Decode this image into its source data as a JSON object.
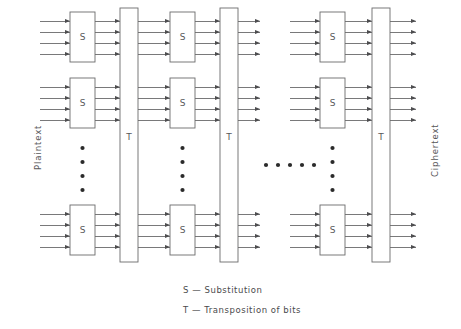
{
  "diagram": {
    "input_label": "Plaintext",
    "output_label": "Ciphertext",
    "box_label_substitution": "S",
    "box_label_transposition": "T",
    "legend": [
      "S — Substitution",
      "T — Transposition of bits"
    ],
    "colors": {
      "stroke": "#6a6a6c",
      "box_stroke": "#6a6a6c",
      "text": "#58585a",
      "background": "#ffffff",
      "dot": "#2b2b2b"
    },
    "structure": {
      "rounds_shown": 3,
      "rounds_elided": true,
      "s_boxes_per_round_shown": 3,
      "s_boxes_per_round_elided": true,
      "bits_per_s_box": 4,
      "vertical_ellipsis_dots": 4,
      "horizontal_ellipsis_dots": 5
    },
    "stages": [
      {
        "name": "round-1",
        "s_column_x": 70,
        "t_column_x": 120
      },
      {
        "name": "round-2",
        "s_column_x": 170,
        "t_column_x": 220
      },
      {
        "name": "round-n",
        "s_column_x": 320,
        "t_column_x": 372
      }
    ],
    "s_box_rows": [
      {
        "name": "top",
        "y": 12
      },
      {
        "name": "middle",
        "y": 78
      },
      {
        "name": "bottom",
        "y": 205
      }
    ],
    "geometry": {
      "s_box_width": 25,
      "s_box_height": 50,
      "t_box_width": 18,
      "t_box_top": 8,
      "t_box_bottom": 262,
      "input_line_start_x": 40,
      "output_line_end_x": 416,
      "bit_spacing": 11,
      "first_bit_offset": 9,
      "t_label_y": 140,
      "v_ellipsis_y_start": 148,
      "v_ellipsis_spacing": 14,
      "h_ellipsis_y": 165,
      "h_ellipsis_x_start": 266,
      "h_ellipsis_spacing": 12
    }
  }
}
